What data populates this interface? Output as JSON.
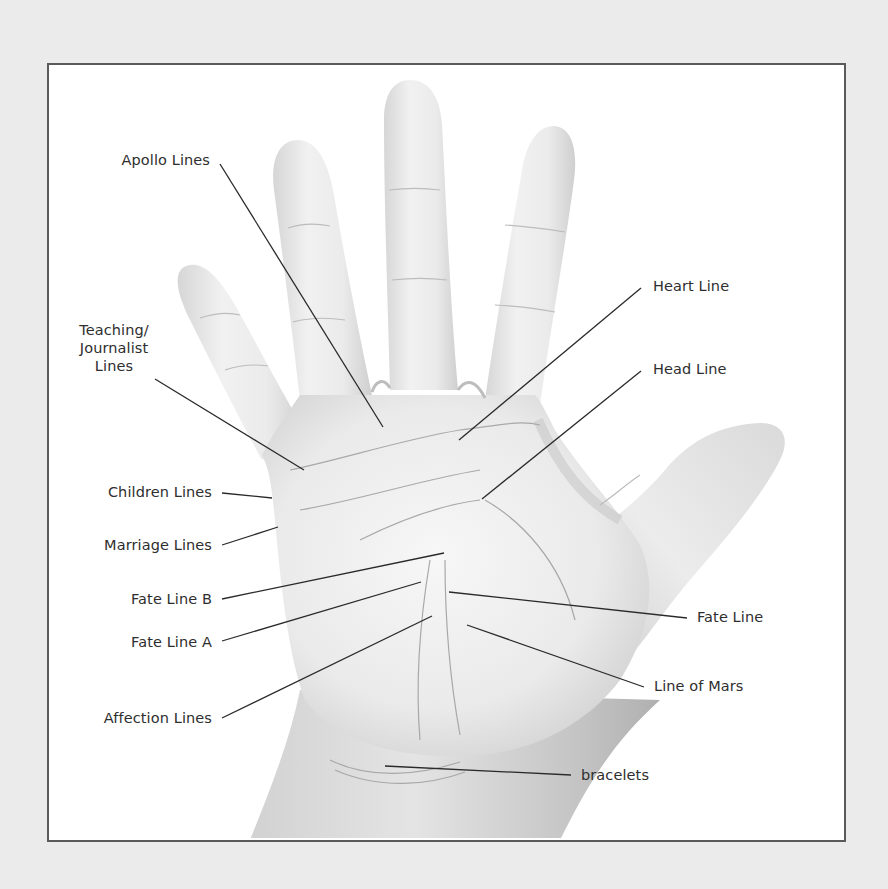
{
  "diagram": {
    "labels": [
      {
        "id": "apollo",
        "text": "Apollo Lines"
      },
      {
        "id": "teaching",
        "text": "Teaching/\nJournalist\nLines",
        "lines": [
          "Teaching/",
          "Journalist",
          "Lines"
        ]
      },
      {
        "id": "children",
        "text": "Children Lines"
      },
      {
        "id": "marriage",
        "text": "Marriage Lines"
      },
      {
        "id": "fate_b",
        "text": "Fate Line B"
      },
      {
        "id": "fate_a",
        "text": "Fate Line A"
      },
      {
        "id": "affection",
        "text": "Affection Lines"
      },
      {
        "id": "heart",
        "text": "Heart Line"
      },
      {
        "id": "head",
        "text": "Head Line"
      },
      {
        "id": "fate",
        "text": "Fate Line"
      },
      {
        "id": "mars",
        "text": "Line of Mars"
      },
      {
        "id": "bracelets",
        "text": "bracelets"
      }
    ],
    "colors": {
      "page_background": "#ebebeb",
      "frame_border": "#5a5a5a",
      "frame_fill": "#ffffff",
      "leader_line": "#2a2a2a",
      "label_text": "#2e2e2e",
      "skin_light": "#f4f4f4",
      "skin_shadow": "#b9b9b9"
    }
  }
}
